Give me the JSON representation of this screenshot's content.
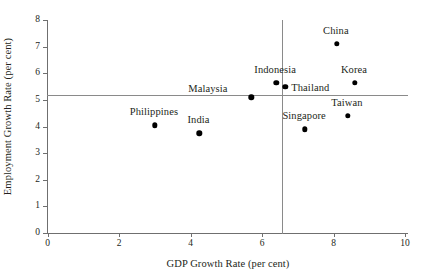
{
  "chart_data": {
    "type": "scatter",
    "title": "",
    "xlabel": "GDP Growth Rate (per cent)",
    "ylabel": "Employment Growth Rate (per cent)",
    "xlim": [
      0,
      10
    ],
    "ylim": [
      0,
      8
    ],
    "xticks": [
      "0",
      "2",
      "4",
      "6",
      "8",
      "10"
    ],
    "xtick_values": [
      0,
      2,
      4,
      6,
      8,
      10
    ],
    "yticks": [
      "0",
      "1",
      "2",
      "3",
      "4",
      "5",
      "6",
      "7",
      "8"
    ],
    "ytick_values": [
      0,
      1,
      2,
      3,
      4,
      5,
      6,
      7,
      8
    ],
    "grid": false,
    "legend": "none",
    "reference_lines": [
      {
        "orientation": "horizontal",
        "value": 5.2,
        "label": "mean employment growth"
      },
      {
        "orientation": "vertical",
        "value": 6.55,
        "label": "mean GDP growth"
      }
    ],
    "points": [
      {
        "name": "Philippines",
        "x": 3.0,
        "y": 4.05,
        "label_dx": -1,
        "label_dy": -13,
        "label_align": "center"
      },
      {
        "name": "India",
        "x": 4.25,
        "y": 3.75,
        "label_dx": -1,
        "label_dy": -13,
        "label_align": "center"
      },
      {
        "name": "Malaysia",
        "x": 5.7,
        "y": 5.1,
        "label_dx": -24,
        "label_dy": -8,
        "label_align": "right"
      },
      {
        "name": "Indonesia",
        "x": 6.4,
        "y": 5.65,
        "label_dx": -1,
        "label_dy": -13,
        "label_align": "center"
      },
      {
        "name": "Thailand",
        "x": 6.65,
        "y": 5.5,
        "label_dx": 6,
        "label_dy": 1,
        "label_align": "left"
      },
      {
        "name": "Singapore",
        "x": 7.2,
        "y": 3.9,
        "label_dx": -1,
        "label_dy": -13,
        "label_align": "center"
      },
      {
        "name": "China",
        "x": 8.1,
        "y": 7.1,
        "label_dx": -1,
        "label_dy": -13,
        "label_align": "center"
      },
      {
        "name": "Taiwan",
        "x": 8.4,
        "y": 4.4,
        "label_dx": -1,
        "label_dy": -13,
        "label_align": "center"
      },
      {
        "name": "Korea",
        "x": 8.6,
        "y": 5.65,
        "label_dx": -1,
        "label_dy": -13,
        "label_align": "center"
      }
    ]
  },
  "colors": {
    "point": "#000000",
    "axis": "#6f6f6f",
    "reference_line": "#8a8a8a",
    "text": "#231f20",
    "background": "#ffffff"
  }
}
